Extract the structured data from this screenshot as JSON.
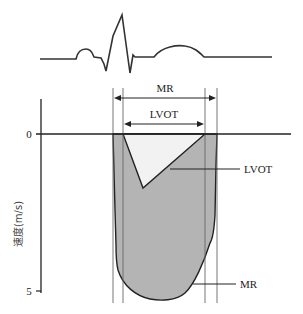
{
  "diagram": {
    "type": "doppler-velocity-schematic",
    "ecg": {
      "label": "ecg-trace"
    },
    "intervals": {
      "mr": {
        "label": "MR"
      },
      "lvot": {
        "label": "LVOT"
      }
    },
    "y_axis": {
      "label": "速度(m/s)",
      "ticks": [
        "0",
        "5"
      ]
    },
    "callouts": {
      "lvot": "LVOT",
      "mr": "MR"
    },
    "colors": {
      "mr_fill": "#b4b4b4",
      "lvot_fill": "#f2f2f2",
      "line": "#222222",
      "guide": "#666666"
    }
  }
}
